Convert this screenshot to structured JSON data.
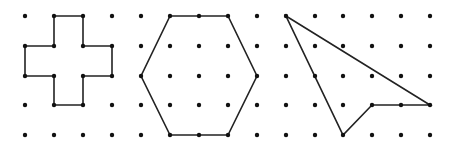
{
  "figure": {
    "grid": {
      "columns_x": [
        25,
        54,
        83,
        112,
        141,
        170,
        199,
        228,
        257,
        286,
        315,
        343,
        372,
        401,
        430
      ],
      "rows_y": [
        16,
        46,
        76,
        105,
        135
      ],
      "dot_radius": 2.2,
      "dot_color": "#111111"
    },
    "shapes": [
      {
        "name": "cross",
        "stroke": "#222222",
        "points": [
          [
            54,
            16
          ],
          [
            83,
            16
          ],
          [
            83,
            46
          ],
          [
            112,
            46
          ],
          [
            112,
            76
          ],
          [
            83,
            76
          ],
          [
            83,
            105
          ],
          [
            54,
            105
          ],
          [
            54,
            76
          ],
          [
            25,
            76
          ],
          [
            25,
            46
          ],
          [
            54,
            46
          ]
        ]
      },
      {
        "name": "hexagon",
        "stroke": "#222222",
        "points": [
          [
            170,
            16
          ],
          [
            228,
            16
          ],
          [
            257,
            76
          ],
          [
            228,
            135
          ],
          [
            170,
            135
          ],
          [
            141,
            76
          ]
        ]
      },
      {
        "name": "arrow",
        "stroke": "#222222",
        "points": [
          [
            286,
            16
          ],
          [
            430,
            105
          ],
          [
            372,
            105
          ],
          [
            343,
            135
          ]
        ]
      }
    ]
  }
}
